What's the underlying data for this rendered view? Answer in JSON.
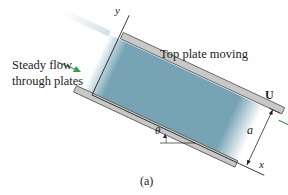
{
  "figure": {
    "caption": "(a)",
    "labels": {
      "steady_flow_line1": "Steady flow",
      "steady_flow_line2": "through plates",
      "top_plate": "Top plate moving",
      "y_axis": "y",
      "x_axis": "x",
      "velocity": "U",
      "gap": "a",
      "angle": "θ"
    },
    "colors": {
      "fluid": "#6f9fb0",
      "plate_fill": "#c8c8c8",
      "plate_edge": "#555555",
      "arrow": "#3a9a50",
      "line": "#222222"
    }
  }
}
